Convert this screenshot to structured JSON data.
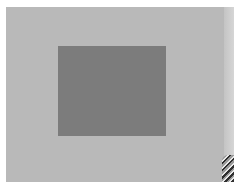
{
  "image": {
    "description": "Gray card photo: light gray background with a darker gray rectangle",
    "colors": {
      "background": "#b9b9b9",
      "inner_square": "#7c7c7c",
      "right_strip": "#d0d0d0",
      "border": "#ffffff",
      "corner_object_dark": "#2f2f2f"
    }
  }
}
